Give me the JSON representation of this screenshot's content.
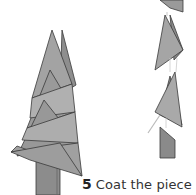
{
  "illustration": {
    "description": "Assembled paper cone tree beside exploded view of stacked cone pieces and trunk",
    "colors": {
      "cone": "#9a9a9a",
      "cone_light": "#b4b4b4",
      "cone_dark": "#7f7f7f",
      "outline": "#3a3a3a",
      "trunk": "#8a8a8a"
    }
  },
  "caption": {
    "step_number": "5",
    "text": "Coat the piece and"
  }
}
